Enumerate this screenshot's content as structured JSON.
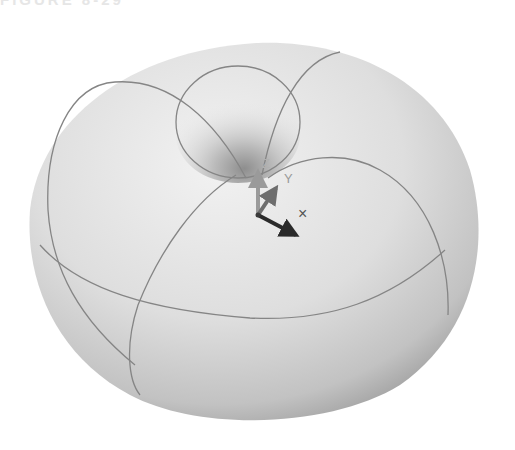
{
  "header": {
    "cut_off_text": "FIGURE 8-29"
  },
  "viewport": {
    "object": "torus",
    "surface_color": "#e3e3e3",
    "edge_shadow_color": "#9a9a9a",
    "isoline_color": "#858585",
    "background": "#ffffff"
  },
  "triad": {
    "x_label": "X",
    "y_label": "Y",
    "z_label": "Z",
    "x_color": "#2a2a2a",
    "y_color": "#6e6e6e",
    "z_color": "#9a9a9a"
  },
  "cursor": {
    "symbol": "×"
  }
}
